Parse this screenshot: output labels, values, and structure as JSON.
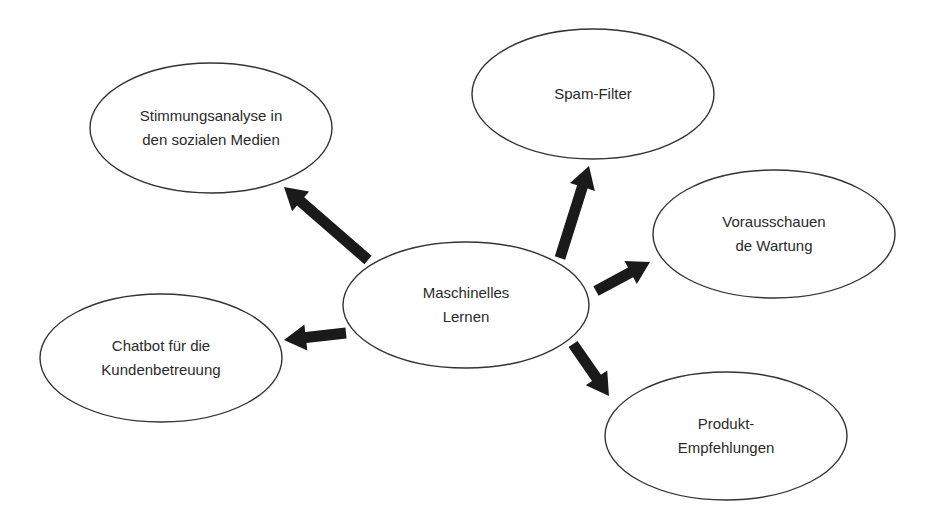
{
  "diagram": {
    "type": "mind-map",
    "colors": {
      "background": "#ffffff",
      "stroke": "#333333",
      "arrow": "#1a1a1a",
      "text": "#2a2a2a"
    },
    "center": {
      "id": "maschinelles-lernen",
      "lines": [
        "Maschinelles",
        "Lernen"
      ],
      "cx": 466,
      "cy": 305,
      "rx": 123,
      "ry": 63
    },
    "nodes": [
      {
        "id": "stimmungsanalyse",
        "lines": [
          "Stimmungsanalyse in",
          "den sozialen Medien"
        ],
        "cx": 211,
        "cy": 128,
        "rx": 121,
        "ry": 65
      },
      {
        "id": "spam-filter",
        "lines": [
          "Spam-Filter"
        ],
        "cx": 593,
        "cy": 94,
        "rx": 121,
        "ry": 65
      },
      {
        "id": "vorausschauende-wartung",
        "lines": [
          "Vorausschauen",
          "de Wartung"
        ],
        "cx": 774,
        "cy": 234,
        "rx": 121,
        "ry": 64
      },
      {
        "id": "chatbot",
        "lines": [
          "Chatbot für die",
          "Kundenbetreuung"
        ],
        "cx": 161,
        "cy": 358,
        "rx": 121,
        "ry": 64
      },
      {
        "id": "produkt-empfehlungen",
        "lines": [
          "Produkt-",
          "Empfehlungen"
        ],
        "cx": 726,
        "cy": 436,
        "rx": 121,
        "ry": 64
      }
    ],
    "arrows": [
      {
        "to": "stimmungsanalyse",
        "x1": 368,
        "y1": 260,
        "x2": 284,
        "y2": 187
      },
      {
        "to": "spam-filter",
        "x1": 560,
        "y1": 258,
        "x2": 589,
        "y2": 166
      },
      {
        "to": "vorausschauende-wartung",
        "x1": 596,
        "y1": 291,
        "x2": 650,
        "y2": 262
      },
      {
        "to": "chatbot",
        "x1": 346,
        "y1": 333,
        "x2": 284,
        "y2": 340
      },
      {
        "to": "produkt-empfehlungen",
        "x1": 573,
        "y1": 344,
        "x2": 609,
        "y2": 396
      }
    ]
  }
}
